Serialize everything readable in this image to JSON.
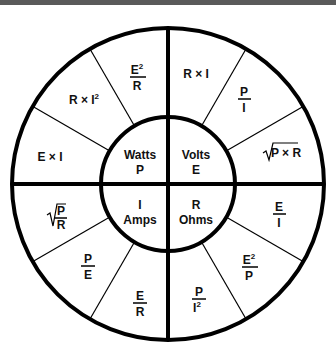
{
  "diagram": {
    "center_quadrants": [
      {
        "id": "watts",
        "line1": "Watts",
        "line2": "P"
      },
      {
        "id": "volts",
        "line1": "Volts",
        "line2": "E"
      },
      {
        "id": "amps",
        "line1": "I",
        "line2": "Amps"
      },
      {
        "id": "ohms",
        "line1": "R",
        "line2": "Ohms"
      }
    ],
    "outer_segments": {
      "watts": [
        {
          "formula": "E × I",
          "type": "text"
        },
        {
          "formula": "R × I²",
          "type": "text",
          "base": "R × I",
          "sup": "2"
        },
        {
          "formula": "E²/R",
          "type": "fraction",
          "num": "E",
          "num_sup": "2",
          "den": "R"
        }
      ],
      "volts": [
        {
          "formula": "R × I",
          "type": "text"
        },
        {
          "formula": "P/I",
          "type": "fraction",
          "num": "P",
          "den": "I"
        },
        {
          "formula": "√(P × R)",
          "type": "sqrt",
          "inner": "P × R"
        }
      ],
      "ohms": [
        {
          "formula": "E/I",
          "type": "fraction",
          "num": "E",
          "den": "I"
        },
        {
          "formula": "E²/P",
          "type": "fraction",
          "num": "E",
          "num_sup": "2",
          "den": "P"
        },
        {
          "formula": "P/I²",
          "type": "fraction",
          "num": "P",
          "den": "I",
          "den_sup": "2"
        }
      ],
      "amps": [
        {
          "formula": "E/R",
          "type": "fraction",
          "num": "E",
          "den": "R"
        },
        {
          "formula": "P/E",
          "type": "fraction",
          "num": "P",
          "den": "E"
        },
        {
          "formula": "√(P/R)",
          "type": "sqrt-fraction",
          "num": "P",
          "den": "R"
        }
      ]
    },
    "colors": {
      "stroke": "#000000",
      "background": "#ffffff",
      "topbar": "#5a5a5a"
    }
  }
}
